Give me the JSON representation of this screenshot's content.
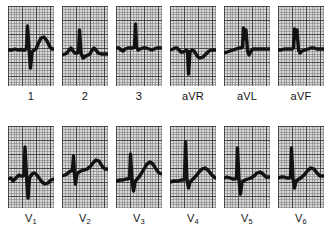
{
  "chart_data": {
    "type": "line",
    "xlabel": "time",
    "ylabel": "voltage",
    "grid": true,
    "legend_position": "none",
    "paper": {
      "background_color": "#d9d9d9",
      "fine_grid_color": "#787878",
      "bold_grid_color": "#3c3c3c",
      "trace_color": "#121212",
      "fine_grid_px": 2.8,
      "bold_grid_px": 14
    },
    "layout": {
      "rows": 2,
      "columns": 6,
      "panel_width_px": 46,
      "panel_height_px": 80
    },
    "series": [
      {
        "name": "I",
        "label": "1",
        "label_sub": "",
        "row": 1,
        "column": 1,
        "morphology": "small upright P, tall narrow R, deep S, broad upright T",
        "path": "M0,44 L4,44 L7,43 L10,44 L13,43.5 L15,44 L17,44 L18.5,42 L19.5,20 L21,43 L22.5,62 L24,46 L26,44 L28,43 L30,38 L33,32 L36,31 L39,35 L42,41 L44,43 L46,43"
      },
      {
        "name": "II",
        "label": "2",
        "label_sub": "",
        "row": 1,
        "column": 2,
        "morphology": "rounded P wave, tall R, small S, low broad T",
        "path": "M0,49 L3,48 L5,47 L7,44 L9,42 L11,45 L13,47 L15,47 L16.5,46 L17.5,24 L19,47 L21,52 L24,50 L26,49 L28,48 L30,44 L32,42 L34,44 L36,47 L39,48 L42,48 L46,48"
      },
      {
        "name": "III",
        "label": "3",
        "label_sub": "",
        "row": 1,
        "column": 3,
        "morphology": "flat baseline, narrow spiky R wave, shallow T",
        "path": "M0,42 L3,42 L5,44 L7,45 L9,43 L12,42 L15,42 L17,42 L18.5,41 L19.5,18 L20.5,41 L22,44 L24,43 L27,42 L30,42 L33,43 L36,44 L38,43 L41,42 L43,42 L46,42"
      },
      {
        "name": "aVR",
        "label": "aVR",
        "label_sub": "",
        "row": 1,
        "column": 4,
        "morphology": "negative deflection, deep QS complex, inverted/low T",
        "path": "M0,44 L3,43 L5,42 L7,42 L9,44 L11,46 L13,46 L15,45 L16.5,44 L17.5,45 L18.5,68 L20,46 L22,44 L24,45 L26,48 L28,51 L30,52 L33,51 L36,48 L39,45 L42,44 L46,44"
      },
      {
        "name": "aVL",
        "label": "aVL",
        "label_sub": "",
        "row": 1,
        "column": 5,
        "morphology": "notched R wave with two peaks, small S, flat T",
        "path": "M0,47 L3,46 L6,45 L9,44 L12,43 L15,42 L17,42 L18.5,41 L19.5,22 L21,33 L22,24 L23.5,45 L25,49 L27,45 L29,43 L32,43 L35,43 L38,43 L41,43 L44,43 L46,43"
      },
      {
        "name": "aVF",
        "label": "aVF",
        "label_sub": "",
        "row": 1,
        "column": 6,
        "morphology": "notched R wave with two peaks, flat baseline, low T",
        "path": "M0,44 L3,44 L6,43 L9,43 L12,43 L14,43 L15.5,42 L16.5,23 L18,32 L19,24 L20.5,44 L22,47 L24,45 L27,44 L30,43 L33,42 L36,42 L39,43 L42,43 L46,43"
      },
      {
        "name": "V1",
        "label": "V",
        "label_sub": "1",
        "row": 2,
        "column": 1,
        "morphology": "small P, tall narrow R, very deep S, inverted T",
        "path": "M0,53 L3,52 L5,55 L7,53 L9,51 L11,49 L13,50 L15,50 L16,49 L17,21 L18.5,50 L20,72 L21.5,52 L24,48 L26,47 L28,48 L31,52 L34,56 L37,58 L40,57 L43,54 L46,53"
      },
      {
        "name": "V2",
        "label": "V",
        "label_sub": "2",
        "row": 2,
        "column": 2,
        "morphology": "sharp narrow RS spike, rising ST segment, prominent upright T",
        "path": "M0,50 L3,49 L5,48 L7,46 L9,45 L10.5,44 L11.5,30 L12.5,48 L13.5,58 L15,48 L17,46 L19,45 L22,44 L25,43 L28,41 L31,37 L34,34 L37,35 L40,40 L43,43 L46,43"
      },
      {
        "name": "V3",
        "label": "V",
        "label_sub": "3",
        "row": 2,
        "column": 3,
        "morphology": "tall R, deep S, rising ST, large rounded T wave",
        "path": "M0,55 L4,54 L7,54 L10,53 L12,53 L13.5,52 L14.5,28 L16,54 L17.5,65 L19,56 L21,53 L23,51 L25,48 L28,43 L31,38 L34,36 L37,38 L40,43 L43,47 L46,48"
      },
      {
        "name": "V4",
        "label": "V",
        "label_sub": "4",
        "row": 2,
        "column": 4,
        "morphology": "very tall thin R wave, small S, upright T",
        "path": "M0,56 L4,55 L8,55 L11,54 L13,54 L14.5,53 L15.5,16 L17,54 L18.5,62 L20,56 L23,53 L26,50 L29,46 L32,43 L35,42 L38,44 L41,48 L44,51 L46,52"
      },
      {
        "name": "V5",
        "label": "V",
        "label_sub": "5",
        "row": 2,
        "column": 5,
        "morphology": "tall R wave, deep narrow S, flat ST, small T",
        "path": "M0,52 L3,51 L6,52 L9,53 L11,53 L12.5,52 L13.5,22 L15,54 L16.5,68 L18,56 L21,54 L24,53 L27,52 L30,50 L33,47 L36,46 L39,48 L42,51 L46,51"
      },
      {
        "name": "V6",
        "label": "V",
        "label_sub": "6",
        "row": 2,
        "column": 6,
        "morphology": "tall narrow R wave, small S, rounded upright T",
        "path": "M0,52 L3,51 L6,51 L9,52 L11,52 L12.5,51 L13.5,22 L15,53 L16.5,62 L18,55 L21,53 L24,51 L27,48 L30,44 L33,42 L36,43 L39,47 L42,50 L46,50"
      }
    ]
  }
}
